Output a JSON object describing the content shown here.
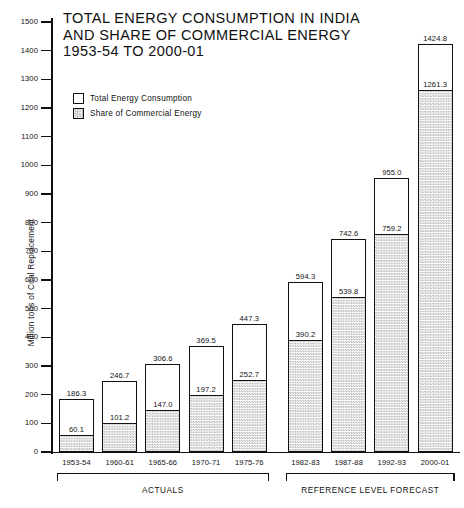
{
  "chart_data": {
    "type": "bar",
    "title": "TOTAL ENERGY CONSUMPTION IN INDIA AND SHARE OF COMMERCIAL ENERGY 1953-54 TO 2000-01",
    "title_lines": [
      "TOTAL ENERGY CONSUMPTION IN INDIA",
      "AND SHARE OF COMMERCIAL ENERGY",
      "1953-54 TO 2000-01"
    ],
    "xlabel": "",
    "ylabel": "Million tons of Coal Replacement",
    "ylim": [
      0,
      1500
    ],
    "ytick_step": 100,
    "yticks": [
      0,
      100,
      200,
      300,
      400,
      500,
      600,
      700,
      800,
      900,
      1000,
      1100,
      1200,
      1300,
      1400,
      1500
    ],
    "ytick_labels": [
      "0",
      "100",
      "200",
      "300",
      "400",
      "500",
      "600",
      "700",
      "800",
      "900",
      "1000",
      "1100",
      "1200",
      "1300",
      "1400",
      "1500"
    ],
    "grid": false,
    "legend_position": "upper-left-inside",
    "categories": [
      "1953-54",
      "1960-61",
      "1965-66",
      "1970-71",
      "1975-76",
      "1982-83",
      "1987-88",
      "1992-93",
      "2000-01"
    ],
    "series": [
      {
        "name": "Total Energy Consumption",
        "style": "outline-white",
        "values": [
          186.3,
          246.7,
          306.6,
          369.5,
          447.3,
          594.3,
          742.6,
          955.0,
          1424.8
        ],
        "labels": [
          "186.3",
          "246.7",
          "306.6",
          "369.5",
          "447.3",
          "594.3",
          "742.6",
          "955.0",
          "1424.8"
        ]
      },
      {
        "name": "Share of Commercial Energy",
        "style": "stipple-hatch",
        "values": [
          60.1,
          101.2,
          147.0,
          197.2,
          252.7,
          390.2,
          539.8,
          759.2,
          1261.3
        ],
        "labels": [
          "60.1",
          "101.2",
          "147.0",
          "197.2",
          "252.7",
          "390.2",
          "539.8",
          "759.2",
          "1261.3"
        ]
      }
    ],
    "groups": [
      {
        "label": "ACTUALS",
        "categories": [
          "1953-54",
          "1960-61",
          "1965-66",
          "1970-71",
          "1975-76"
        ]
      },
      {
        "label": "REFERENCE LEVEL FORECAST",
        "categories": [
          "1982-83",
          "1987-88",
          "1992-93",
          "2000-01"
        ]
      }
    ],
    "annotations": []
  },
  "legend": {
    "items": [
      {
        "label": "Total Energy Consumption",
        "swatch": "white-outline"
      },
      {
        "label": "Share of Commercial Energy",
        "swatch": "hatched"
      }
    ]
  },
  "colors": {
    "ink": "#111111",
    "background": "#ffffff",
    "hatch": "#bdbdbd"
  }
}
